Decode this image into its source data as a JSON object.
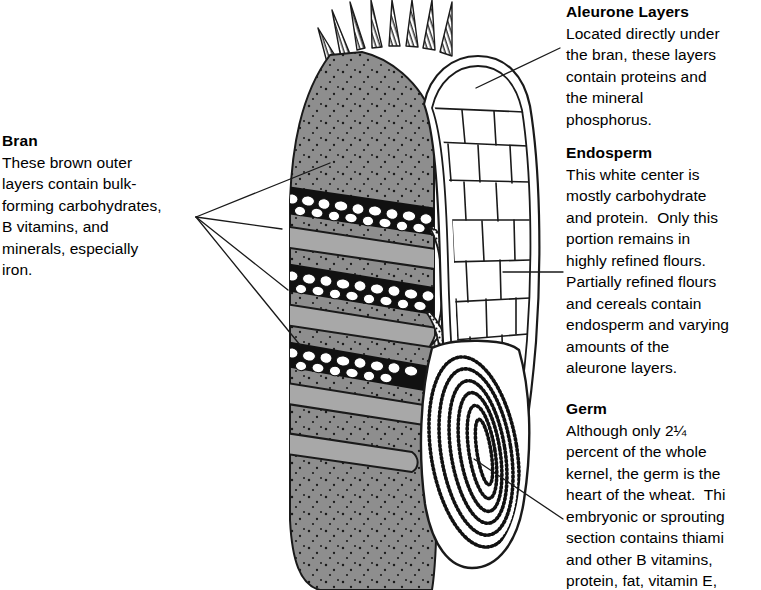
{
  "figure": {
    "line_color": "#1a1a1a",
    "bran_fill": "#8e8e8e",
    "bran_peel_fill": "#a8a8a8",
    "white_fill": "#ffffff",
    "background": "#ffffff"
  },
  "labels": {
    "bran": {
      "heading": "Bran",
      "lines": [
        "These brown outer",
        "layers contain bulk-",
        "forming carbohydrates,",
        "B vitamins, and",
        "minerals, especially",
        "iron."
      ]
    },
    "aleurone": {
      "heading": "Aleurone Layers",
      "lines": [
        "Located directly under",
        "the bran, these layers",
        "contain proteins and",
        "the mineral",
        "phosphorus."
      ]
    },
    "endosperm": {
      "heading": "Endosperm",
      "lines": [
        "This white center is",
        "mostly carbohydrate",
        "and protein.  Only this",
        "portion remains in",
        "highly refined flours.",
        "Partially refined flours",
        "and cereals contain",
        "endosperm and varying",
        "amounts of the",
        "aleurone layers."
      ]
    },
    "germ": {
      "heading": "Germ",
      "lines": [
        "Although only 2¼",
        "percent of the whole",
        "kernel, the germ is the",
        "heart of the wheat.  Thi",
        "embryonic or sprouting",
        "section contains thiami",
        "and other B vitamins,",
        "protein, fat, vitamin E,"
      ]
    }
  },
  "diagram_parts": {
    "brush_hairs": "brush-hairs",
    "bran_coat": "bran-outer-coat",
    "peeled_bran_flaps": "peeled-bran-layers",
    "cellular_bran_layer": "cellular-bran-layer",
    "aleurone_cells": "aleurone-cell-layer",
    "endosperm_body": "endosperm-body",
    "germ_embryo": "germ-embryo"
  }
}
